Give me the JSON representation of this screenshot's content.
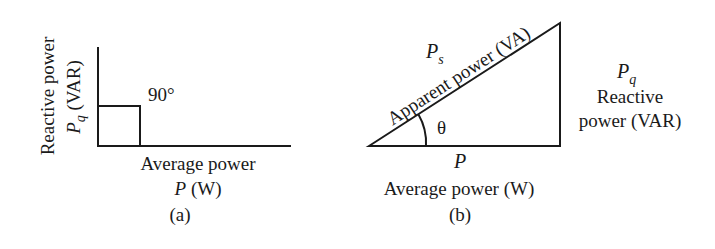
{
  "colors": {
    "ink": "#1a1a1a",
    "background": "#ffffff"
  },
  "panel_a": {
    "caption": "(a)",
    "vertical_axis_label_line1": "Reactive power",
    "vertical_axis_symbol": "P",
    "vertical_axis_subscript": "q",
    "vertical_axis_unit": " (VAR)",
    "angle_label": "90°",
    "horizontal_axis_label_line1": "Average power",
    "horizontal_axis_symbol": "P",
    "horizontal_axis_unit": " (W)"
  },
  "panel_b": {
    "caption": "(b)",
    "hypotenuse_symbol": "P",
    "hypotenuse_subscript": "s",
    "hypotenuse_label": "Apparent power (VA)",
    "angle_label": "θ",
    "vertical_side_symbol": "P",
    "vertical_side_subscript": "q",
    "vertical_side_label_line1": "Reactive",
    "vertical_side_label_line2": "power (VAR)",
    "base_symbol": "P",
    "base_label": "Average power (W)"
  }
}
